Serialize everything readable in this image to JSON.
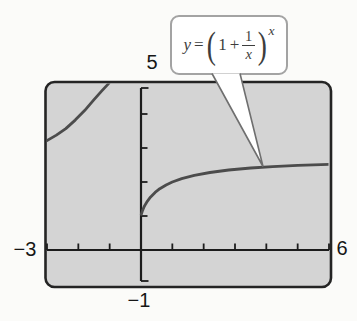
{
  "figure": {
    "y_max_label": "5",
    "x_min_label": "−3",
    "x_max_label": "6",
    "y_min_label": "−1"
  },
  "callout": {
    "lhs": "y",
    "equals": "=",
    "paren_open": "(",
    "one": "1",
    "plus": "+",
    "frac_num": "1",
    "frac_den": "x",
    "paren_close": ")",
    "exponent": "x"
  },
  "colors": {
    "window_fill": "#d4d4d4",
    "window_border": "#242424",
    "axis": "#1c1c1c",
    "curve": "#4c4c4c",
    "callout_border": "#a3a3a3",
    "callout_border_dark": "#6f6f6f",
    "formula_text": "#3d3d3d"
  },
  "chart_data": {
    "type": "line",
    "title": "",
    "equation_label": "y = (1 + 1/x)^x",
    "xlabel": "",
    "ylabel": "",
    "xlim": [
      -3,
      6
    ],
    "ylim": [
      -1,
      5
    ],
    "x_tick_step": 1,
    "y_tick_step": 1,
    "x_ticks": [
      -3,
      -2,
      -1,
      0,
      1,
      2,
      3,
      4,
      5,
      6
    ],
    "y_ticks": [
      1,
      2,
      3,
      4
    ],
    "axis_end_labels": {
      "x_left": "−3",
      "x_right": "6",
      "y_top": "5",
      "y_bottom": "−1"
    },
    "grid": false,
    "legend_position": "callout pointing to right branch",
    "series": [
      {
        "name": "right-branch (x > 0)",
        "x": [
          0.01,
          0.05,
          0.1,
          0.15,
          0.2,
          0.3,
          0.45,
          0.6,
          0.8,
          1,
          1.3,
          1.7,
          2.2,
          2.8,
          3.5,
          4.2,
          5,
          6
        ],
        "y": [
          1.047,
          1.164,
          1.271,
          1.357,
          1.431,
          1.553,
          1.694,
          1.802,
          1.913,
          2.0,
          2.1,
          2.196,
          2.279,
          2.352,
          2.412,
          2.453,
          2.488,
          2.522
        ]
      },
      {
        "name": "left-branch-as-drawn (x < 0)",
        "x": [
          -3,
          -2.7,
          -2.4,
          -2.1,
          -1.8,
          -1.5,
          -1.25,
          -1.05,
          -0.92
        ],
        "y": [
          3.22,
          3.38,
          3.57,
          3.82,
          4.1,
          4.42,
          4.68,
          4.88,
          5.05
        ]
      }
    ]
  }
}
